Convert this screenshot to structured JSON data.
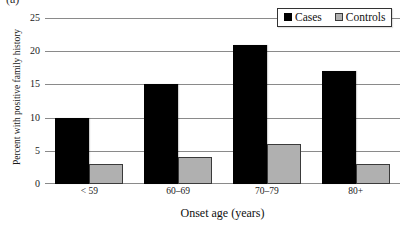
{
  "figure": {
    "panel_label": "(a)"
  },
  "legend": {
    "position": "top-right",
    "items": [
      {
        "label": "Cases",
        "color": "#000000",
        "swatch": "filled-square-icon"
      },
      {
        "label": "Controls",
        "color": "#b0b0b0",
        "swatch": "filled-square-icon"
      }
    ]
  },
  "chart_data": {
    "type": "bar",
    "title": "",
    "subtitle": "",
    "xlabel": "Onset age (years)",
    "ylabel": "Percent with positive family history",
    "categories": [
      "< 59",
      "60–69",
      "70–79",
      "80+"
    ],
    "series": [
      {
        "name": "Cases",
        "color": "#000000",
        "values": [
          10,
          15,
          21,
          17
        ]
      },
      {
        "name": "Controls",
        "color": "#b0b0b0",
        "values": [
          3,
          4,
          6,
          3
        ]
      }
    ],
    "ylim": [
      0,
      25
    ],
    "yticks": [
      0,
      5,
      10,
      15,
      20,
      25
    ],
    "ytick_labels": [
      "0",
      "5",
      "10",
      "15",
      "20",
      "25"
    ],
    "xlim_categorical": true,
    "grid": {
      "horizontal": true,
      "vertical": false,
      "color": "#8a8a8a"
    },
    "legend_position": "top-right",
    "annotations": []
  }
}
